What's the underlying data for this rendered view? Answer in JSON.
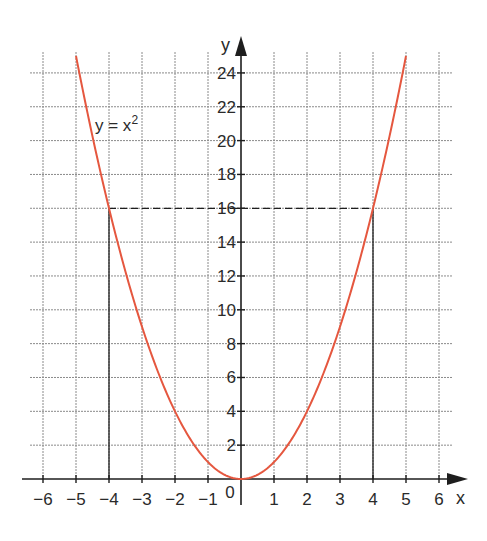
{
  "chart_data": {
    "type": "line",
    "title": "",
    "xlabel": "x",
    "ylabel": "y",
    "xlim": [
      -6,
      6
    ],
    "ylim": [
      0,
      25
    ],
    "grid": true,
    "x_ticks": [
      -6,
      -5,
      -4,
      -3,
      -2,
      -1,
      0,
      1,
      2,
      3,
      4,
      5,
      6
    ],
    "x_tick_labels": [
      "−6",
      "−5",
      "−4",
      "−3",
      "−2",
      "−1",
      "0",
      "1",
      "2",
      "3",
      "4",
      "5",
      "6"
    ],
    "y_ticks": [
      2,
      4,
      6,
      8,
      10,
      12,
      14,
      16,
      18,
      20,
      22,
      24
    ],
    "y_tick_labels": [
      "2",
      "4",
      "6",
      "8",
      "10",
      "12",
      "14",
      "16",
      "18",
      "20",
      "22",
      "24"
    ],
    "series": [
      {
        "name": "y = x²",
        "function": "x^2",
        "color": "#e5573f",
        "x": [
          -5,
          -4,
          -3,
          -2,
          -1,
          0,
          1,
          2,
          3,
          4,
          5
        ],
        "values": [
          25,
          16,
          9,
          4,
          1,
          0,
          1,
          4,
          9,
          16,
          25
        ]
      }
    ],
    "annotations": [
      {
        "type": "label",
        "text_base": "y = x",
        "text_sup": "2",
        "x": -4.4,
        "y": 20.6
      },
      {
        "type": "dashed-hline",
        "y": 16,
        "x_from": -4,
        "x_to": 4
      },
      {
        "type": "solid-vline",
        "x": -4,
        "y_from": 0,
        "y_to": 16
      },
      {
        "type": "solid-vline",
        "x": 4,
        "y_from": 0,
        "y_to": 16
      }
    ],
    "colors": {
      "curve": "#e5573f",
      "axis": "#1e1e1e",
      "grid": "#8a8a8a",
      "text": "#2a2a2a"
    }
  }
}
